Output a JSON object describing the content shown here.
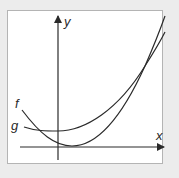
{
  "diagram": {
    "type": "function-graph",
    "axes": {
      "x_label": "x",
      "y_label": "y"
    },
    "curves": [
      {
        "name": "f",
        "label": "f",
        "description": "steeper parabola, minimum just right of y-axis near x-axis"
      },
      {
        "name": "g",
        "label": "g",
        "description": "flatter parabola, minimum near the y-axis, intersects f on both sides"
      }
    ],
    "colors": {
      "background": "#ececec",
      "panel": "#ffffff",
      "panel_border": "#b4b4b4",
      "stroke": "#2a2a2a"
    }
  }
}
